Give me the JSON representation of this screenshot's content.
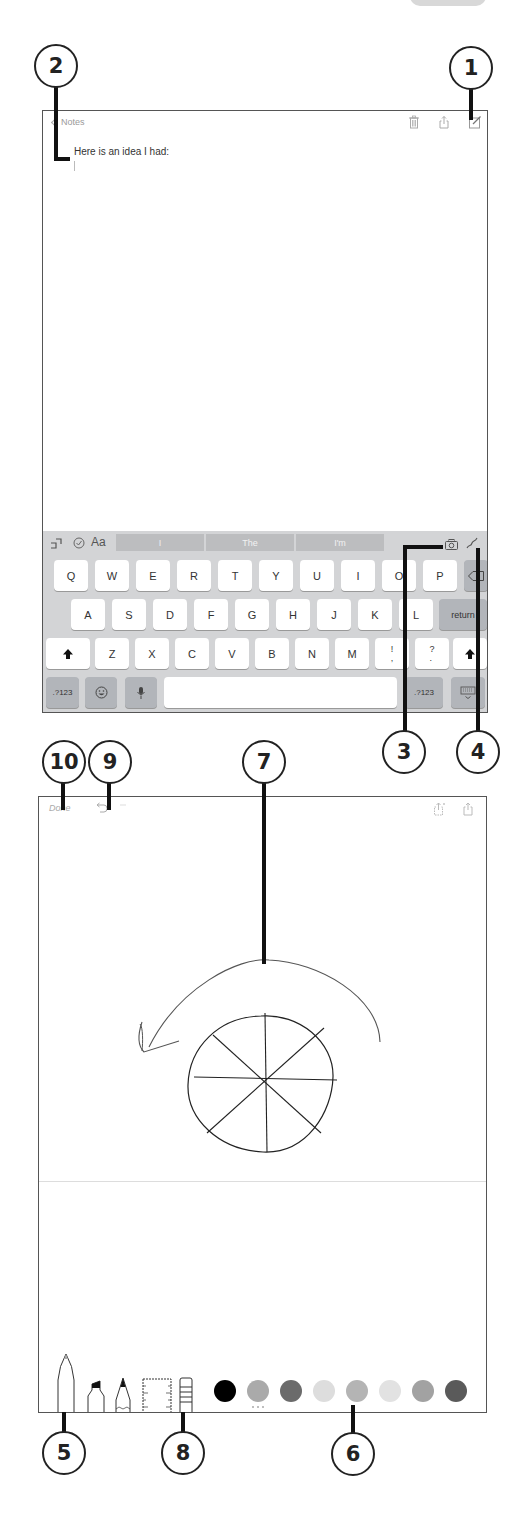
{
  "callouts": [
    {
      "id": "1",
      "label": "1",
      "target": "compose-button"
    },
    {
      "id": "2",
      "label": "2",
      "target": "note-body"
    },
    {
      "id": "3",
      "label": "3",
      "target": "camera-button"
    },
    {
      "id": "4",
      "label": "4",
      "target": "sketch-button"
    },
    {
      "id": "5",
      "label": "5",
      "target": "pen-tool"
    },
    {
      "id": "6",
      "label": "6",
      "target": "color-palette"
    },
    {
      "id": "7",
      "label": "7",
      "target": "canvas"
    },
    {
      "id": "8",
      "label": "8",
      "target": "eraser-tool"
    },
    {
      "id": "9",
      "label": "9",
      "target": "undo-button"
    },
    {
      "id": "10",
      "label": "10",
      "target": "done-button"
    }
  ],
  "note_editor": {
    "nav": {
      "back_label": "Notes",
      "icons": [
        "trash-icon",
        "share-icon",
        "compose-icon"
      ]
    },
    "body_text": "Here is an idea I had:"
  },
  "keyboard": {
    "toolbar": {
      "left_icons": [
        "undo-icon",
        "checklist-icon",
        "format-icon"
      ],
      "format_label": "Aa",
      "suggestions": [
        "I",
        "The",
        "I'm"
      ],
      "right_icons": [
        "camera-icon",
        "sketch-icon"
      ]
    },
    "rows": [
      [
        "Q",
        "W",
        "E",
        "R",
        "T",
        "Y",
        "U",
        "I",
        "O",
        "P"
      ],
      [
        "A",
        "S",
        "D",
        "F",
        "G",
        "H",
        "J",
        "K",
        "L"
      ],
      [
        "Z",
        "X",
        "C",
        "V",
        "B",
        "N",
        "M",
        "!\n,",
        "?\n."
      ]
    ],
    "return_label": "return",
    "numbers_label": ".?123",
    "numbers_right_label": ".?123"
  },
  "drawing": {
    "nav": {
      "done_label": "Done",
      "icons": [
        "undo-icon",
        "redo-icon",
        "add-page-icon",
        "share-icon"
      ]
    },
    "tools": [
      "pen",
      "marker",
      "pencil",
      "ruler",
      "eraser"
    ],
    "colors": [
      "#000000",
      "#aaaaaa",
      "#6b6b6b",
      "#dddddd",
      "#b4b4b4",
      "#e2e2e2",
      "#a2a2a2",
      "#5a5a5a"
    ],
    "selected_color_index": 4
  }
}
